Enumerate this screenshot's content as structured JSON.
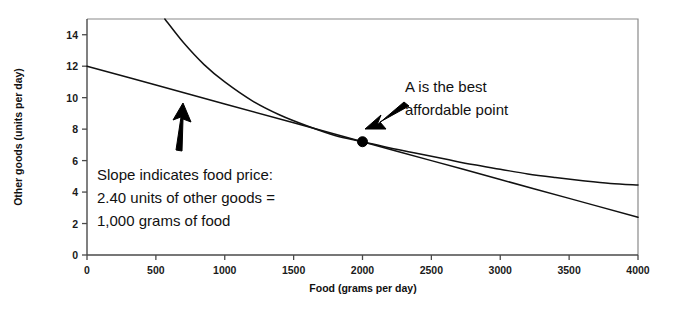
{
  "chart_data": {
    "type": "line",
    "title": "",
    "xlabel": "Food (grams per day)",
    "ylabel": "Other goods (units per day)",
    "xlim": [
      0,
      4000
    ],
    "ylim": [
      0,
      15
    ],
    "grid": false,
    "legend_position": "none",
    "xticks": [
      0,
      500,
      1000,
      1500,
      2000,
      2500,
      3000,
      3500,
      4000
    ],
    "xtick_labels": [
      "0",
      "500",
      "1000",
      "1500",
      "2000",
      "2500",
      "3000",
      "3500",
      "4000"
    ],
    "yticks": [
      0,
      2,
      4,
      6,
      8,
      10,
      12,
      14
    ],
    "ytick_labels": [
      "0",
      "2",
      "4",
      "6",
      "8",
      "10",
      "12",
      "14"
    ],
    "series": [
      {
        "name": "budget-line",
        "description": "Budget line, slope 2.40 units of other goods per 1,000 grams of food",
        "points": [
          [
            0,
            12.0
          ],
          [
            500,
            10.8
          ],
          [
            1000,
            9.6
          ],
          [
            1500,
            8.4
          ],
          [
            2000,
            7.2
          ],
          [
            2500,
            6.0
          ],
          [
            3000,
            4.8
          ],
          [
            3500,
            3.6
          ],
          [
            4000,
            2.4
          ]
        ]
      },
      {
        "name": "indifference-curve",
        "description": "Indifference curve tangent to the budget line at point A",
        "points": [
          [
            565,
            15.0
          ],
          [
            700,
            13.5
          ],
          [
            850,
            12.1
          ],
          [
            1000,
            11.0
          ],
          [
            1200,
            9.8
          ],
          [
            1400,
            8.9
          ],
          [
            1600,
            8.2
          ],
          [
            1800,
            7.6
          ],
          [
            2000,
            7.2
          ],
          [
            2200,
            6.8
          ],
          [
            2400,
            6.45
          ],
          [
            2600,
            6.1
          ],
          [
            2800,
            5.75
          ],
          [
            3000,
            5.45
          ],
          [
            3200,
            5.15
          ],
          [
            3400,
            4.92
          ],
          [
            3600,
            4.72
          ],
          [
            3800,
            4.55
          ],
          [
            4000,
            4.45
          ]
        ]
      }
    ],
    "points_of_interest": [
      {
        "name": "A",
        "x": 2000,
        "y": 7.2,
        "label": "A is the best affordable point"
      }
    ],
    "annotations": [
      {
        "name": "slope-annotation",
        "lines": [
          "Slope indicates food price:",
          "2.40 units of other goods =",
          "1,000 grams of food"
        ]
      },
      {
        "name": "point-a-annotation",
        "lines": [
          "A is the best",
          "affordable point"
        ]
      }
    ],
    "colors": {
      "curve": "#111111",
      "axis": "#4a4a4a",
      "frame": "#8a8a8a",
      "text": "#111111",
      "marker": "#000000",
      "background": "#ffffff"
    }
  }
}
